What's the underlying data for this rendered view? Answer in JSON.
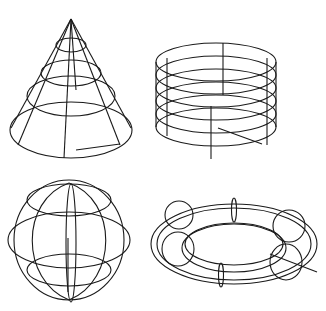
{
  "figure": {
    "background": "#ffffff",
    "stroke": "#1a1a1a",
    "shapes": [
      {
        "name": "cone",
        "label": "Cone wireframe"
      },
      {
        "name": "cylinder",
        "label": "Cylinder wireframe"
      },
      {
        "name": "sphere",
        "label": "Sphere wireframe"
      },
      {
        "name": "torus",
        "label": "Torus wireframe"
      }
    ]
  }
}
